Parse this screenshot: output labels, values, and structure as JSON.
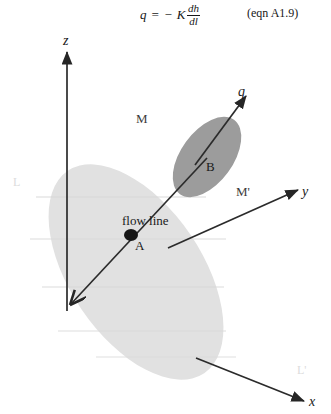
{
  "figure": {
    "type": "scientific-diagram",
    "equation": {
      "lhs": "q = − K",
      "fraction_numerator": "dh",
      "fraction_denominator": "dl",
      "full_text": "q = −K dh/dl",
      "number": "(eqn A1.9)"
    },
    "axes": [
      {
        "name": "z-axis",
        "label": "z",
        "direction": "up"
      },
      {
        "name": "y-axis",
        "label": "y",
        "direction": "up-right"
      },
      {
        "name": "x-axis",
        "label": "x",
        "direction": "down-right"
      }
    ],
    "vectors": [
      {
        "name": "flux-vector",
        "label": "q",
        "direction": "up-right",
        "origin": "point B"
      },
      {
        "name": "flow-line",
        "label": "flow line",
        "direction": "down-left",
        "through": "point A"
      }
    ],
    "points": [
      {
        "name": "point-a",
        "label": "A",
        "marker": "filled-dot"
      },
      {
        "name": "point-b",
        "label": "B",
        "marker": "none"
      }
    ],
    "planes": [
      {
        "name": "plane-m",
        "label": "M",
        "shade": "dark",
        "description": "tilted cross-section ellipse containing B"
      },
      {
        "name": "plane-m-prime",
        "label": "M'",
        "shade": "none",
        "description": "label for second plane"
      },
      {
        "name": "equipotential-surface",
        "label": "",
        "shade": "light",
        "description": "large light-gray ellipse containing A"
      }
    ],
    "faint_marks": [
      {
        "name": "faint-label-l",
        "label": "L"
      },
      {
        "name": "faint-label-l-prime",
        "label": "L'"
      }
    ],
    "colors": {
      "ink": "#1a1a1a",
      "light_ellipse": "#e0e0e0",
      "dark_ellipse": "#9a9a9a",
      "faint_text": "#dcdcdc",
      "background": "#ffffff"
    }
  }
}
